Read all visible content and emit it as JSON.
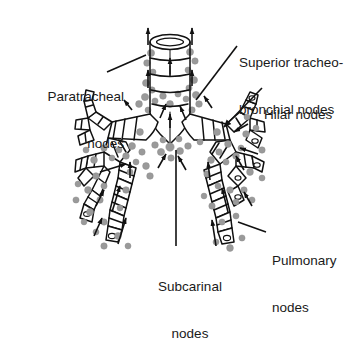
{
  "figure": {
    "background_color": "#ffffff",
    "line_color": "#111111",
    "node_color": "#9a9a9a",
    "node_stroke": "#8a8a8a",
    "text_color": "#1a1a1a"
  },
  "labels": {
    "paratracheal": {
      "line1": "Paratracheal",
      "line2": "nodes",
      "x": 14,
      "y": 58,
      "align": "right"
    },
    "superior_tracheobronchial": {
      "line1": "Superior tracheo-",
      "line2": "bronchial nodes",
      "x": 239,
      "y": 24,
      "align": "left"
    },
    "hilar": {
      "line1": "Hilar nodes",
      "line2": "",
      "x": 258,
      "y": 76,
      "align": "left"
    },
    "pulmonary": {
      "line1": "Pulmonary",
      "line2": "nodes",
      "x": 269,
      "y": 222,
      "align": "left"
    },
    "subcarinal": {
      "line1": "Subcarinal",
      "line2": "nodes",
      "x": 190,
      "y": 248,
      "align": "center"
    }
  },
  "anatomy": {
    "trachea_label": "trachea",
    "carina_label": "carina",
    "right_main_bronchus_label": "right-main-bronchus",
    "left_main_bronchus_label": "left-main-bronchus",
    "lymph_node_count": 78,
    "flow_arrow_count": 22
  }
}
